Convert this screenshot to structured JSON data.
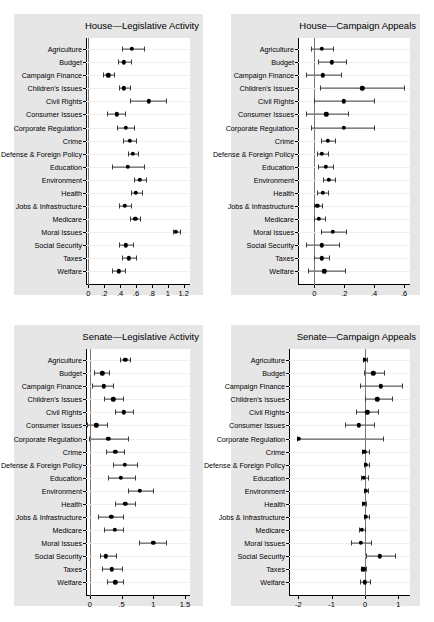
{
  "figure": {
    "categories": [
      "Agriculture",
      "Budget",
      "Campaign Finance",
      "Children's Issues",
      "Civil Rights",
      "Consumer Issues",
      "Corporate Regulation",
      "Crime",
      "Defense & Foreign Policy",
      "Education",
      "Environment",
      "Health",
      "Jobs & Infrastructure",
      "Medicare",
      "Moral Issues",
      "Social Security",
      "Taxes",
      "Welfare"
    ],
    "marker_color": "#000000",
    "panel_background": "#e6e6e6",
    "plot_background": "#ffffff"
  },
  "chart_data": [
    {
      "type": "scatter",
      "id": "house-legislative-activity",
      "title": "House—Legislative Activity",
      "xlabel": "",
      "ylabel": "",
      "orientation": "horizontal",
      "grid": true,
      "legend": false,
      "xlim": [
        -0.03,
        1.28
      ],
      "xticks": [
        0,
        0.2,
        0.4,
        0.6,
        0.8,
        1,
        1.2
      ],
      "xticklabels": [
        "0",
        ".2",
        ".4",
        ".6",
        ".8",
        "1",
        "1.2"
      ],
      "categories": [
        "Agriculture",
        "Budget",
        "Campaign Finance",
        "Children's Issues",
        "Civil Rights",
        "Consumer Issues",
        "Corporate Regulation",
        "Crime",
        "Defense & Foreign Policy",
        "Education",
        "Environment",
        "Health",
        "Jobs & Infrastructure",
        "Medicare",
        "Moral Issues",
        "Social Security",
        "Taxes",
        "Welfare"
      ],
      "estimates": [
        0.55,
        0.45,
        0.25,
        0.45,
        0.76,
        0.36,
        0.47,
        0.52,
        0.56,
        0.5,
        0.65,
        0.6,
        0.46,
        0.59,
        1.1,
        0.47,
        0.51,
        0.38
      ],
      "ci_low": [
        0.42,
        0.37,
        0.19,
        0.38,
        0.53,
        0.24,
        0.36,
        0.44,
        0.5,
        0.3,
        0.57,
        0.54,
        0.39,
        0.53,
        1.06,
        0.38,
        0.42,
        0.3
      ],
      "ci_high": [
        0.7,
        0.54,
        0.32,
        0.53,
        0.98,
        0.46,
        0.57,
        0.6,
        0.62,
        0.7,
        0.73,
        0.67,
        0.54,
        0.65,
        1.15,
        0.56,
        0.6,
        0.46
      ]
    },
    {
      "type": "scatter",
      "id": "house-campaign-appeals",
      "title": "House—Campaign Appeals",
      "xlabel": "",
      "ylabel": "",
      "orientation": "horizontal",
      "grid": true,
      "legend": false,
      "xlim": [
        -0.11,
        0.64
      ],
      "xticks": [
        0,
        0.2,
        0.4,
        0.6
      ],
      "xticklabels": [
        "0",
        ".2",
        ".4",
        ".6"
      ],
      "zero_reference_line": 0,
      "categories": [
        "Agriculture",
        "Budget",
        "Campaign Finance",
        "Children's Issues",
        "Civil Rights",
        "Consumer Issues",
        "Corporate Regulation",
        "Crime",
        "Defense & Foreign Policy",
        "Education",
        "Environment",
        "Health",
        "Jobs & Infrastructure",
        "Medicare",
        "Moral Issues",
        "Social Security",
        "Taxes",
        "Welfare"
      ],
      "estimates": [
        0.05,
        0.115,
        0.055,
        0.32,
        0.195,
        0.08,
        0.195,
        0.09,
        0.05,
        0.075,
        0.095,
        0.055,
        0.02,
        0.03,
        0.125,
        0.05,
        0.05,
        0.065
      ],
      "ci_low": [
        -0.025,
        0.025,
        -0.055,
        0.035,
        -0.005,
        -0.055,
        -0.025,
        0.045,
        0.015,
        0.025,
        0.06,
        0.02,
        -0.005,
        -0.005,
        0.045,
        -0.055,
        0.0,
        -0.045
      ],
      "ci_high": [
        0.125,
        0.21,
        0.175,
        0.6,
        0.4,
        0.225,
        0.4,
        0.135,
        0.09,
        0.125,
        0.135,
        0.09,
        0.05,
        0.07,
        0.21,
        0.165,
        0.1,
        0.205
      ]
    },
    {
      "type": "scatter",
      "id": "senate-legislative-activity",
      "title": "Senate—Legislative Activity",
      "xlabel": "",
      "ylabel": "",
      "orientation": "horizontal",
      "grid": true,
      "legend": false,
      "xlim": [
        -0.06,
        1.58
      ],
      "xticks": [
        0,
        0.5,
        1,
        1.5
      ],
      "xticklabels": [
        "0",
        ".5",
        "1",
        "1.5"
      ],
      "zero_reference_line": 0,
      "categories": [
        "Agriculture",
        "Budget",
        "Campaign Finance",
        "Children's Issues",
        "Civil Rights",
        "Consumer Issues",
        "Corporate Regulation",
        "Crime",
        "Defense & Foreign Policy",
        "Education",
        "Environment",
        "Health",
        "Jobs & Infrastructure",
        "Medicare",
        "Moral Issues",
        "Social Security",
        "Taxes",
        "Welfare"
      ],
      "estimates": [
        0.56,
        0.2,
        0.22,
        0.37,
        0.54,
        0.1,
        0.29,
        0.4,
        0.55,
        0.49,
        0.79,
        0.56,
        0.34,
        0.39,
        1.0,
        0.25,
        0.35,
        0.4
      ],
      "ci_low": [
        0.48,
        0.07,
        0.04,
        0.22,
        0.4,
        -0.04,
        -0.01,
        0.25,
        0.37,
        0.28,
        0.6,
        0.4,
        0.13,
        0.23,
        0.78,
        0.16,
        0.2,
        0.27
      ],
      "ci_high": [
        0.64,
        0.3,
        0.37,
        0.53,
        0.68,
        0.27,
        0.6,
        0.54,
        0.74,
        0.71,
        0.99,
        0.72,
        0.53,
        0.53,
        1.2,
        0.41,
        0.51,
        0.52
      ]
    },
    {
      "type": "scatter",
      "id": "senate-campaign-appeals",
      "title": "Senate—Campaign Appeals",
      "xlabel": "",
      "ylabel": "",
      "orientation": "horizontal",
      "grid": true,
      "legend": false,
      "xlim": [
        -2.28,
        1.35
      ],
      "xticks": [
        -2,
        -1,
        0,
        1
      ],
      "xticklabels": [
        "-2",
        "-1",
        "0",
        "1"
      ],
      "zero_reference_line": 0,
      "categories": [
        "Agriculture",
        "Budget",
        "Campaign Finance",
        "Children's Issues",
        "Civil Rights",
        "Consumer Issues",
        "Corporate Regulation",
        "Crime",
        "Defense & Foreign Policy",
        "Education",
        "Environment",
        "Health",
        "Jobs & Infrastructure",
        "Medicare",
        "Moral Issues",
        "Social Security",
        "Taxes",
        "Welfare"
      ],
      "estimates": [
        0.0,
        0.25,
        0.47,
        0.37,
        0.07,
        -0.18,
        -1.98,
        -0.02,
        0.03,
        -0.03,
        0.02,
        -0.03,
        0.03,
        -0.1,
        -0.13,
        0.45,
        -0.05,
        0.0
      ],
      "ci_low": [
        -0.06,
        -0.04,
        -0.14,
        0.01,
        -0.26,
        -0.6,
        -2.05,
        -0.09,
        -0.03,
        -0.13,
        -0.04,
        -0.09,
        -0.03,
        -0.18,
        -0.42,
        0.02,
        -0.12,
        -0.16
      ],
      "ci_high": [
        0.07,
        0.57,
        1.1,
        0.8,
        0.4,
        0.26,
        0.54,
        0.11,
        0.12,
        0.1,
        0.1,
        0.04,
        0.12,
        -0.01,
        0.17,
        0.9,
        0.02,
        0.16
      ]
    }
  ]
}
